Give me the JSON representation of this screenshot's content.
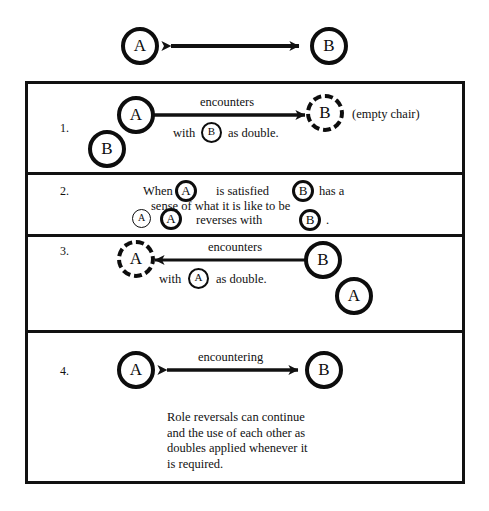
{
  "figure": {
    "title_glyphs": {
      "a": "A",
      "b": "B"
    },
    "header": {
      "left_circle": "A",
      "right_circle": "B",
      "arrow": "double-headed-arrow"
    },
    "rows": [
      {
        "number": "1.",
        "circles": [
          {
            "label": "A",
            "style": "solid"
          },
          {
            "label": "B",
            "style": "solid"
          },
          {
            "label": "B",
            "style": "dashed"
          },
          {
            "label": "B",
            "style": "solid-inline"
          }
        ],
        "arrow_label": "encounters",
        "sub_label_pre": "with",
        "sub_label_post": "as double.",
        "aside": "(empty chair)"
      },
      {
        "number": "2.",
        "line1_a": "When",
        "line1_b": "is satisfied",
        "line1_c": "has a",
        "line2": "sense of what it is like to be",
        "line3_a": "reverses with",
        "line3_b": ".",
        "circles": [
          {
            "label": "A",
            "style": "solid-inline"
          },
          {
            "label": "B",
            "style": "solid-inline"
          },
          {
            "label": "A",
            "style": "solid-inline"
          },
          {
            "label": "A",
            "style": "solid-inline"
          },
          {
            "label": "B",
            "style": "solid-inline"
          }
        ]
      },
      {
        "number": "3.",
        "circles": [
          {
            "label": "A",
            "style": "dashed"
          },
          {
            "label": "B",
            "style": "solid"
          },
          {
            "label": "A",
            "style": "solid"
          },
          {
            "label": "A",
            "style": "solid-inline"
          }
        ],
        "arrow_label": "encounters",
        "sub_label_pre": "with",
        "sub_label_post": "as double."
      },
      {
        "number": "4.",
        "circles": [
          {
            "label": "A",
            "style": "solid"
          },
          {
            "label": "B",
            "style": "solid"
          }
        ],
        "arrow_label": "encountering",
        "paragraph": "Role reversals can continue\nand the use of each other as\ndoubles applied whenever it\nis required."
      }
    ],
    "colors": {
      "ink": "#111111",
      "paper": "#ffffff"
    }
  }
}
